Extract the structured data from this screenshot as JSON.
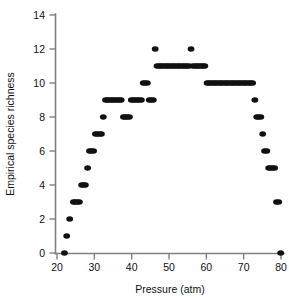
{
  "chart_data": {
    "type": "scatter",
    "title": "",
    "subtitle": "",
    "xlabel": "Pressure (atm)",
    "ylabel": "Empirical species richness",
    "xlim": [
      19,
      81
    ],
    "ylim": [
      -0.45,
      14
    ],
    "xticks": [
      20,
      30,
      40,
      50,
      60,
      70,
      80
    ],
    "xticklabels": [
      "20",
      "30",
      "40",
      "50",
      "60",
      "70",
      "80"
    ],
    "yticks": [
      0,
      2,
      4,
      6,
      8,
      10,
      12,
      14
    ],
    "yticklabels": [
      "0",
      "2",
      "4",
      "6",
      "8",
      "10",
      "12",
      "14"
    ],
    "grid": false,
    "legend": null,
    "marker": {
      "shape": "circle",
      "color": "#111111",
      "size_px": 5.6
    },
    "annotations": [],
    "series": [
      {
        "name": "Empirical species richness",
        "color": "#111111",
        "x": [
          22.0,
          22.6,
          23.4,
          24.4,
          24.9,
          25.4,
          26.0,
          26.6,
          27.1,
          27.6,
          28.2,
          28.7,
          29.2,
          29.8,
          30.3,
          30.8,
          31.4,
          31.9,
          32.4,
          33.0,
          33.5,
          34.0,
          34.6,
          35.1,
          35.6,
          36.2,
          36.7,
          37.2,
          37.8,
          38.3,
          38.8,
          39.4,
          39.9,
          40.4,
          41.0,
          41.5,
          42.0,
          42.6,
          43.1,
          43.6,
          44.2,
          44.7,
          45.2,
          45.8,
          46.3,
          46.8,
          47.4,
          47.9,
          48.4,
          49.0,
          49.5,
          50.0,
          50.6,
          51.1,
          51.6,
          52.2,
          52.7,
          53.2,
          53.8,
          54.3,
          54.8,
          55.4,
          55.9,
          56.4,
          57.0,
          57.5,
          58.0,
          58.6,
          59.1,
          59.6,
          60.2,
          60.7,
          61.2,
          61.8,
          62.3,
          62.8,
          63.4,
          63.9,
          64.4,
          65.0,
          65.5,
          66.0,
          66.6,
          67.1,
          67.6,
          68.2,
          68.7,
          69.2,
          69.8,
          70.3,
          70.8,
          71.4,
          71.9,
          72.4,
          73.0,
          73.5,
          74.0,
          74.6,
          75.1,
          75.6,
          76.2,
          76.7,
          77.2,
          77.8,
          78.3,
          78.8,
          79.4,
          79.9
        ],
        "y": [
          0,
          1,
          2,
          3,
          3,
          3,
          3,
          4,
          4,
          4,
          5,
          6,
          6,
          6,
          7,
          7,
          7,
          7,
          8,
          9,
          9,
          9,
          9,
          9,
          9,
          9,
          9,
          9,
          8,
          8,
          8,
          8,
          9,
          9,
          9,
          9,
          9,
          9,
          10,
          10,
          10,
          9,
          9,
          9,
          12,
          11,
          11,
          11,
          11,
          11,
          11,
          11,
          11,
          11,
          11,
          11,
          11,
          11,
          11,
          11,
          11,
          11,
          12,
          11,
          11,
          11,
          11,
          11,
          11,
          11,
          10,
          10,
          10,
          10,
          10,
          10,
          10,
          10,
          10,
          10,
          10,
          10,
          10,
          10,
          10,
          10,
          10,
          10,
          10,
          10,
          10,
          10,
          10,
          10,
          9,
          8,
          8,
          8,
          7,
          6,
          6,
          5,
          5,
          5,
          5,
          3,
          3,
          0
        ]
      }
    ],
    "point_count": 113
  }
}
